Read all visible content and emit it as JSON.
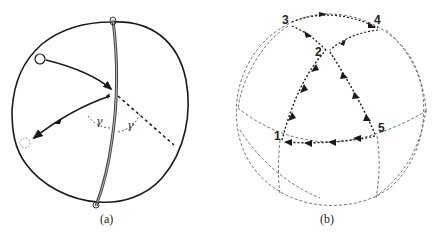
{
  "figure": {
    "panel_a": {
      "caption": "(a)",
      "angle_labels": [
        "γ",
        "γ"
      ],
      "elements": [
        "sphere-outline",
        "mirror-great-circle",
        "incoming-ray",
        "reflected-ray",
        "extended-ray-dashed",
        "source-circle",
        "image-circle-dashed"
      ]
    },
    "panel_b": {
      "caption": "(b)",
      "points": [
        {
          "label": "1"
        },
        {
          "label": "2"
        },
        {
          "label": "3"
        },
        {
          "label": "4"
        },
        {
          "label": "5"
        }
      ],
      "path_order": [
        "1",
        "2",
        "3",
        "4",
        "2",
        "5",
        "1"
      ]
    },
    "colors": {
      "stroke": "#1a1a1a",
      "dashed": "#555555",
      "background": "#ffffff"
    }
  }
}
